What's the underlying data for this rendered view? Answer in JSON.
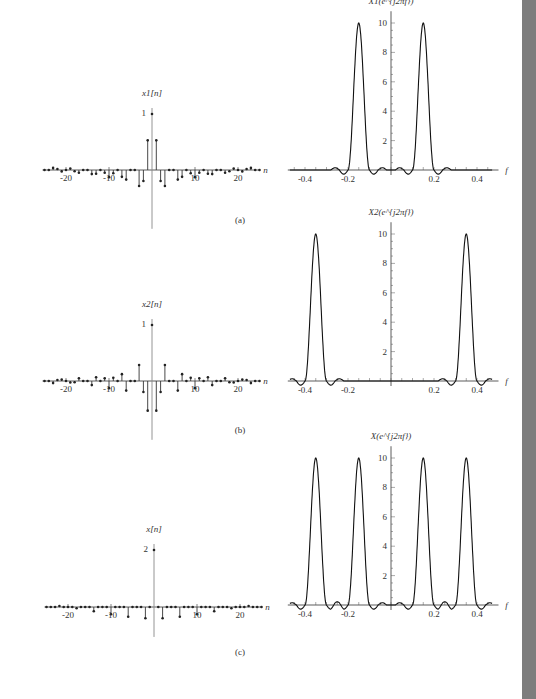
{
  "figure": {
    "panels": [
      {
        "label": "(a)",
        "time_title": "x1[n]",
        "time_peak": "1",
        "freq_title": "X1(e^{j2πf})"
      },
      {
        "label": "(b)",
        "time_title": "x2[n]",
        "time_peak": "1",
        "freq_title": "X2(e^{j2πf})"
      },
      {
        "label": "(c)",
        "time_title": "x[n]",
        "time_peak": "2",
        "freq_title": "X(e^{j2πf})"
      }
    ],
    "time_axis_label": "n",
    "freq_axis_label": "f",
    "time_ticks": [
      "-20",
      "-10",
      "10",
      "20"
    ],
    "freq_ticks_a": [
      "-0.4",
      "-0.2",
      "0.2",
      "0.4"
    ],
    "freq_ticks_b": [
      "-0.4",
      "-0.2",
      "0.2",
      "0.4"
    ],
    "freq_ticks_c": [
      "-0.4",
      "-0.2",
      "0.2",
      "0.4"
    ],
    "y_ticks": [
      "2",
      "4",
      "6",
      "8",
      "10"
    ]
  },
  "chart_data": [
    {
      "type": "stem",
      "title": "x1[n]",
      "xlabel": "n",
      "xlim": [
        -25,
        25
      ],
      "ylim": [
        -1,
        1
      ],
      "x": [
        -12,
        -11,
        -10,
        -9,
        -8,
        -7,
        -6,
        -5,
        -4,
        -3,
        -2,
        -1,
        0,
        1,
        2,
        3,
        4,
        5,
        6,
        7,
        8,
        9,
        10,
        11,
        12
      ],
      "values": [
        0.7,
        0.85,
        0.85,
        0.55,
        0,
        -0.45,
        -0.9,
        -1.0,
        -0.85,
        -0.45,
        0.35,
        0.85,
        1.0,
        0.85,
        0.35,
        -0.45,
        -0.85,
        -1.0,
        -0.9,
        -0.45,
        0,
        0.55,
        0.85,
        0.85,
        0.7
      ],
      "note": "cosine-modulated sinc, main lobe at n=0"
    },
    {
      "type": "line",
      "title": "X1(e^{j2πf})",
      "xlabel": "f",
      "xlim": [
        -0.5,
        0.5
      ],
      "ylim": [
        0,
        10
      ],
      "peaks": [
        {
          "f": -0.15,
          "value": 10
        },
        {
          "f": 0.15,
          "value": 10
        }
      ],
      "xticks": [
        -0.4,
        -0.2,
        0.2,
        0.4
      ],
      "yticks": [
        2,
        4,
        6,
        8,
        10
      ]
    },
    {
      "type": "stem",
      "title": "x2[n]",
      "xlabel": "n",
      "xlim": [
        -25,
        25
      ],
      "ylim": [
        -1,
        1
      ],
      "note": "cosine-modulated sinc at f=0.35, peak 1 at n=0"
    },
    {
      "type": "line",
      "title": "X2(e^{j2πf})",
      "xlabel": "f",
      "xlim": [
        -0.5,
        0.5
      ],
      "ylim": [
        0,
        10
      ],
      "peaks": [
        {
          "f": -0.35,
          "value": 10
        },
        {
          "f": 0.35,
          "value": 10
        }
      ],
      "xticks": [
        -0.4,
        -0.2,
        0.2,
        0.4
      ],
      "yticks": [
        2,
        4,
        6,
        8,
        10
      ]
    },
    {
      "type": "stem",
      "title": "x[n]",
      "xlabel": "n",
      "xlim": [
        -25,
        25
      ],
      "ylim": [
        -2,
        2
      ],
      "note": "x[n] = x1[n] + x2[n], peak 2 at n=0"
    },
    {
      "type": "line",
      "title": "X(e^{j2πf})",
      "xlabel": "f",
      "xlim": [
        -0.5,
        0.5
      ],
      "ylim": [
        0,
        10
      ],
      "peaks": [
        {
          "f": -0.35,
          "value": 10
        },
        {
          "f": -0.15,
          "value": 10
        },
        {
          "f": 0.15,
          "value": 10
        },
        {
          "f": 0.35,
          "value": 10
        }
      ],
      "xticks": [
        -0.4,
        -0.2,
        0.2,
        0.4
      ],
      "yticks": [
        2,
        4,
        6,
        8,
        10
      ]
    }
  ]
}
